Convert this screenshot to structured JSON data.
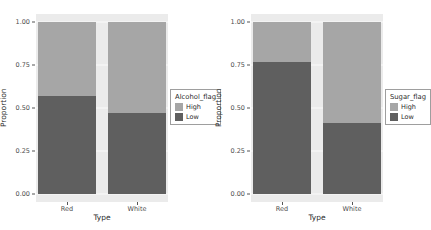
{
  "colors": {
    "high": "#a6a6a6",
    "low": "#5f5f5f",
    "panel": "#ebebeb",
    "grid": "#ffffff",
    "axis_text": "#4d4d4d",
    "background": "#ffffff",
    "legend_border": "#9e9e9e"
  },
  "chart_data": [
    {
      "type": "bar",
      "subtype": "stacked_proportion",
      "title": "",
      "xlabel": "Type",
      "ylabel": "Proportion",
      "categories": [
        "Red",
        "White"
      ],
      "series": [
        {
          "name": "High",
          "values": [
            0.43,
            0.53
          ]
        },
        {
          "name": "Low",
          "values": [
            0.57,
            0.47
          ]
        }
      ],
      "stack_order_top_to_bottom": [
        "High",
        "Low"
      ],
      "legend_title": "Alcohol_flag",
      "legend_position": "right",
      "ylim": [
        0,
        1
      ],
      "yticks": [
        "1.00",
        "0.75",
        "0.50",
        "0.25",
        "0.00"
      ],
      "ytick_values": [
        1.0,
        0.75,
        0.5,
        0.25,
        0.0
      ],
      "grid": true
    },
    {
      "type": "bar",
      "subtype": "stacked_proportion",
      "title": "",
      "xlabel": "Type",
      "ylabel": "Proportion",
      "categories": [
        "Red",
        "White"
      ],
      "series": [
        {
          "name": "High",
          "values": [
            0.23,
            0.59
          ]
        },
        {
          "name": "Low",
          "values": [
            0.77,
            0.41
          ]
        }
      ],
      "stack_order_top_to_bottom": [
        "High",
        "Low"
      ],
      "legend_title": "Sugar_flag",
      "legend_position": "right",
      "ylim": [
        0,
        1
      ],
      "yticks": [
        "1.00",
        "0.75",
        "0.50",
        "0.25",
        "0.00"
      ],
      "ytick_values": [
        1.0,
        0.75,
        0.5,
        0.25,
        0.0
      ],
      "grid": true
    }
  ]
}
